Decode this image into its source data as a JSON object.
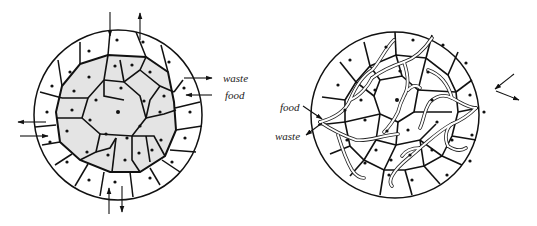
{
  "figure": {
    "left_panel": {
      "description": "Spherical cell mass without vascular supply; outer cells exchange directly with environment, inner cells shaded",
      "labels": {
        "waste": "waste",
        "food": "food"
      },
      "colors": {
        "inner_cells": "#e4e4e4",
        "outer_cells": "#ffffff",
        "outline": "#111111"
      }
    },
    "right_panel": {
      "description": "Spherical cell mass with branching transport channels delivering food and removing waste",
      "labels": {
        "food": "food",
        "waste": "waste"
      },
      "colors": {
        "cells": "#ffffff",
        "channels": "#ffffff",
        "outline": "#111111"
      }
    }
  }
}
